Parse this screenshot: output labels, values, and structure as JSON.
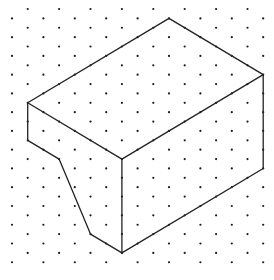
{
  "diagram": {
    "type": "isometric-dot-grid-drawing",
    "background": "#ffffff",
    "grid": {
      "dot_color": "#1a1a1a",
      "dot_radius": 1.1,
      "origin_x": 12,
      "origin_y": 9,
      "col_spacing": 15.7,
      "row_spacing": 9.38,
      "columns": 17,
      "rows": 28
    },
    "shape": {
      "name": "isometric prism with cut-away corner",
      "stroke": "#222222",
      "stroke_width": 1.3,
      "vertices_grid": {
        "top_back": [
          10,
          1
        ],
        "right_top": [
          16,
          7
        ],
        "front_top": [
          7,
          16
        ],
        "left_top": [
          1,
          10
        ],
        "left_bottom": [
          1,
          14
        ],
        "notch_upper": [
          3,
          16
        ],
        "notch_lower": [
          5,
          24
        ],
        "front_bottom": [
          7,
          26
        ],
        "right_bottom": [
          16,
          17
        ]
      },
      "edges": [
        [
          "left_top",
          "top_back"
        ],
        [
          "top_back",
          "right_top"
        ],
        [
          "right_top",
          "front_top"
        ],
        [
          "front_top",
          "left_top"
        ],
        [
          "left_top",
          "left_bottom"
        ],
        [
          "left_bottom",
          "notch_upper"
        ],
        [
          "notch_upper",
          "notch_lower"
        ],
        [
          "notch_lower",
          "front_bottom"
        ],
        [
          "front_top",
          "front_bottom"
        ],
        [
          "front_bottom",
          "right_bottom"
        ],
        [
          "right_top",
          "right_bottom"
        ]
      ]
    }
  }
}
